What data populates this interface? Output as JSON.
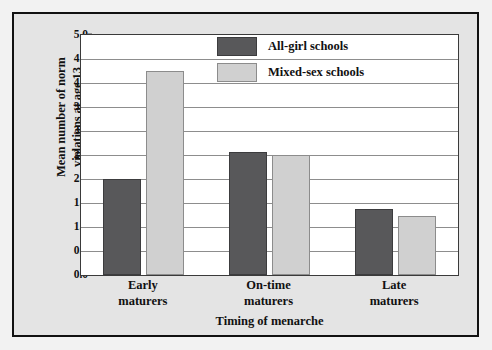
{
  "chart_data": {
    "type": "bar",
    "title": "",
    "xlabel": "Timing of menarche",
    "ylabel_line1": "Mean number of norm",
    "ylabel_line2": "violations at age 13",
    "categories": [
      "Early maturers",
      "On-time maturers",
      "Late maturers"
    ],
    "category_lines": [
      [
        "Early",
        "maturers"
      ],
      [
        "On-time",
        "maturers"
      ],
      [
        "Late",
        "maturers"
      ]
    ],
    "series": [
      {
        "name": "All-girl schools",
        "color": "#58585a",
        "values": [
          2.0,
          2.57,
          1.37
        ]
      },
      {
        "name": "Mixed-sex schools",
        "color": "#d0d0d0",
        "values": [
          4.25,
          2.5,
          1.22
        ]
      }
    ],
    "ylim": [
      0.0,
      5.0
    ],
    "ytick_values": [
      0.0,
      0.5,
      1.0,
      1.5,
      2.0,
      2.5,
      3.0,
      3.5,
      4.0,
      4.5,
      5.0
    ],
    "ytick_labels": [
      "0.0",
      "0.5",
      "1.0",
      "1.5",
      "2.0",
      "2.5",
      "3.0",
      "3.5",
      "4.0",
      "4.5",
      "5.0"
    ],
    "grid": "horizontal",
    "legend_position": "top-right-inside",
    "legend": [
      {
        "label": "All-girl schools",
        "swatch": "dark"
      },
      {
        "label": "Mixed-sex schools",
        "swatch": "light"
      }
    ]
  },
  "figure": {
    "background_color": "#e4e4e4",
    "plot_background_color": "#ffffff",
    "frame_color": "#111111"
  }
}
